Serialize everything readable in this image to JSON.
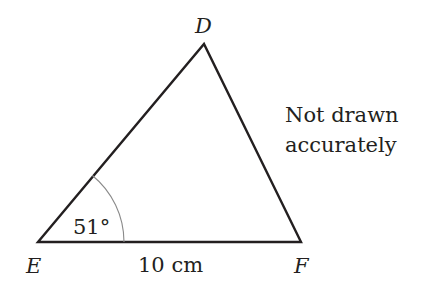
{
  "diagram": {
    "type": "triangle",
    "vertices": {
      "D": {
        "label": "D"
      },
      "E": {
        "label": "E"
      },
      "F": {
        "label": "F"
      }
    },
    "angle_E": {
      "label": "51°",
      "value_degrees": 51
    },
    "side_EF": {
      "label": "10 cm",
      "value": 10,
      "unit": "cm"
    },
    "note_line1": "Not drawn",
    "note_line2": "accurately",
    "colors": {
      "line": "#231f20",
      "arc": "#8a8a8a",
      "background": "#ffffff"
    }
  }
}
